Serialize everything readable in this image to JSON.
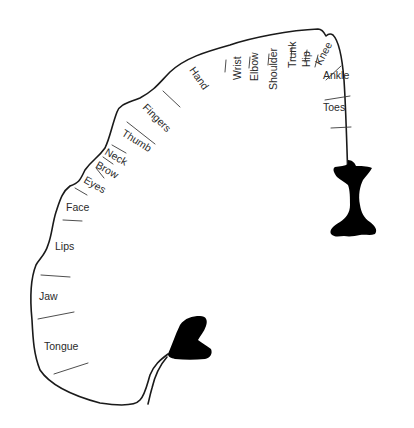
{
  "diagram": {
    "type": "motor homunculus cortical map",
    "colors": {
      "outline": "#1a1a1a",
      "text": "#2a2a2a",
      "blob": "#000000",
      "background": "#ffffff"
    },
    "labels": [
      {
        "id": "toes",
        "text": "Toes"
      },
      {
        "id": "ankle",
        "text": "Ankle"
      },
      {
        "id": "knee",
        "text": "Knee"
      },
      {
        "id": "hip",
        "text": "Hip"
      },
      {
        "id": "trunk",
        "text": "Trunk"
      },
      {
        "id": "shoulder",
        "text": "Shoulder"
      },
      {
        "id": "elbow",
        "text": "Elbow"
      },
      {
        "id": "wrist",
        "text": "Wrist"
      },
      {
        "id": "hand",
        "text": "Hand"
      },
      {
        "id": "fingers",
        "text": "Fingers"
      },
      {
        "id": "thumb",
        "text": "Thumb"
      },
      {
        "id": "neck",
        "text": "Neck"
      },
      {
        "id": "brow",
        "text": "Brow"
      },
      {
        "id": "eyes",
        "text": "Eyes"
      },
      {
        "id": "face",
        "text": "Face"
      },
      {
        "id": "lips",
        "text": "Lips"
      },
      {
        "id": "jaw",
        "text": "Jaw"
      },
      {
        "id": "tongue",
        "text": "Tongue"
      }
    ],
    "fill_shapes": [
      "upper-right-blob",
      "lower-middle-blob"
    ]
  }
}
